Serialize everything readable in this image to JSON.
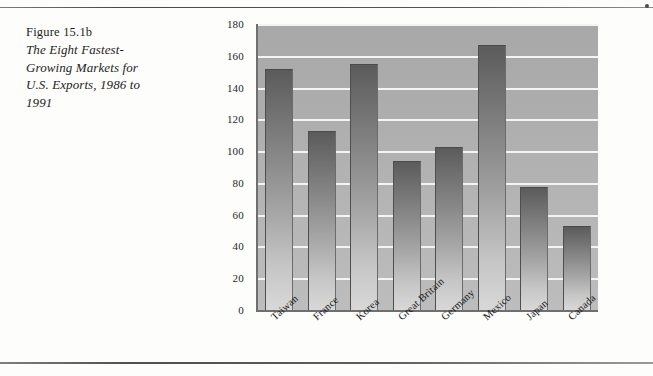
{
  "page": {
    "caption_figure_number": "Figure 15.1b",
    "caption_title_lines": [
      "The Eight Fastest-",
      "Growing Markets for",
      "U.S. Exports, 1986 to",
      "1991"
    ],
    "rule_color": "#555555",
    "corner_dot": "page-corner-mark"
  },
  "chart_data": {
    "type": "bar",
    "categories": [
      "Taiwan",
      "France",
      "Korea",
      "Great Britain",
      "Germany",
      "Mexico",
      "Japan",
      "Canada"
    ],
    "values": [
      151,
      112,
      154,
      93,
      102,
      166,
      77,
      52
    ],
    "xlabel": "",
    "ylabel": "",
    "ylim": [
      0,
      180
    ],
    "ytick_step": 20,
    "yticks": [
      180,
      160,
      140,
      120,
      100,
      80,
      60,
      40,
      20,
      0
    ],
    "grid": true,
    "grid_orientation": "horizontal",
    "grid_color": "#f4f4f4",
    "plot_background": "#b0b0b0",
    "bar_fill_top": "#5b5b5b",
    "bar_fill_bottom": "#d8d8d8",
    "legend": null,
    "legend_position": "none",
    "x_label_rotation_deg": -42
  }
}
